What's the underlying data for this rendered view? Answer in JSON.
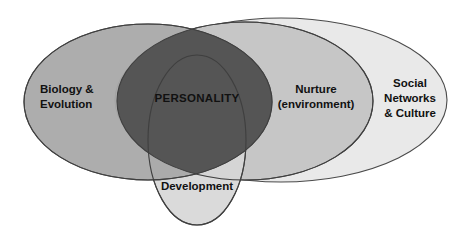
{
  "diagram": {
    "type": "venn",
    "background_color": "#ffffff",
    "stroke_color": "#4a4a4a",
    "text_color": "#111111",
    "sets": [
      {
        "id": "biology",
        "name": "biology-evolution-ellipse",
        "label_lines": [
          "Biology &",
          "Evolution"
        ],
        "fill_color": "#a9a9a9",
        "cx": 148,
        "cy": 102,
        "rx": 124,
        "ry": 78
      },
      {
        "id": "nurture",
        "name": "nurture-environment-ellipse",
        "label_lines": [
          "Nurture",
          "(environment)"
        ],
        "fill_color": "#c6c6c6",
        "cx": 245,
        "cy": 101,
        "rx": 128,
        "ry": 79
      },
      {
        "id": "social",
        "name": "social-networks-culture-ellipse",
        "label_lines": [
          "Social",
          "Networks",
          "& Culture"
        ],
        "fill_color": "#e9e9e9",
        "cx": 281,
        "cy": 100,
        "rx": 166,
        "ry": 82
      },
      {
        "id": "development",
        "name": "development-ellipse",
        "label_lines": [
          "Development"
        ],
        "fill_color": "#d6d6d6",
        "cx": 197,
        "cy": 140,
        "rx": 49,
        "ry": 85
      }
    ],
    "intersection": {
      "id": "personality",
      "name": "personality-core",
      "label_lines": [
        "PERSONALITY"
      ],
      "fill_color": "#555555"
    }
  }
}
